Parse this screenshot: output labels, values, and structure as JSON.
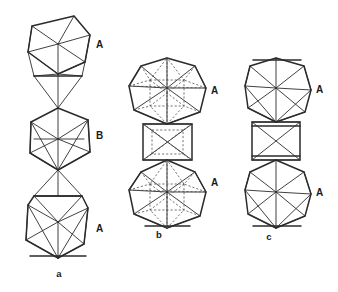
{
  "figure": {
    "background_color": "#ffffff",
    "line_color": "#2b2b2b",
    "hidden_edge_color": "#4a4a4a",
    "panels": [
      {
        "id": "a",
        "caption": "a",
        "caption_x": 59,
        "caption_y": 277,
        "description": "vertex-sharing chain of three polyhedra drawn with visible edges only",
        "units": [
          {
            "label": "A",
            "label_x": 96,
            "label_y": 48,
            "kind": "icosahedron"
          },
          {
            "label": "B",
            "label_x": 96,
            "label_y": 139,
            "kind": "icosahedron"
          },
          {
            "label": "A",
            "label_x": 96,
            "label_y": 232,
            "kind": "icosahedron"
          }
        ]
      },
      {
        "id": "b",
        "caption": "b",
        "caption_x": 159,
        "caption_y": 238,
        "description": "two polyhedra joined by a square antiprism, hidden edges dashed",
        "units": [
          {
            "label": "A",
            "label_x": 211,
            "label_y": 94,
            "kind": "icosahedron"
          },
          {
            "label": "A",
            "label_x": 211,
            "label_y": 186,
            "kind": "icosahedron"
          }
        ]
      },
      {
        "id": "c",
        "caption": "c",
        "caption_x": 269,
        "caption_y": 240,
        "description": "two polyhedra joined by a square prism, visible edges only",
        "units": [
          {
            "label": "A",
            "label_x": 316,
            "label_y": 93,
            "kind": "icosahedron"
          },
          {
            "label": "A",
            "label_x": 316,
            "label_y": 196,
            "kind": "icosahedron"
          }
        ]
      }
    ]
  }
}
